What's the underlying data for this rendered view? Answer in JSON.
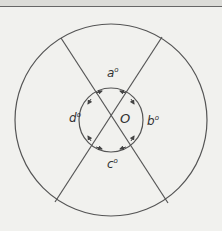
{
  "diagram": {
    "center_label": "O",
    "angles": [
      {
        "name": "a",
        "label": "a",
        "unit": "o"
      },
      {
        "name": "b",
        "label": "b",
        "unit": "o"
      },
      {
        "name": "c",
        "label": "c",
        "unit": "o"
      },
      {
        "name": "d",
        "label": "d",
        "unit": "o"
      }
    ],
    "colors": {
      "stroke": "#555555",
      "background": "#f1f1ee"
    }
  }
}
